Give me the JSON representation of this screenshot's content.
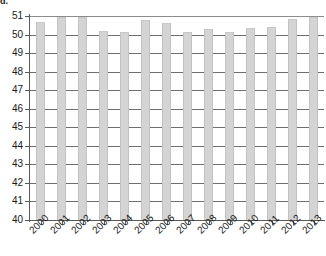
{
  "figure": {
    "label": "d.",
    "background": "#ffffff"
  },
  "style": {
    "bar_fill": "#d4d4d4",
    "bar_edge": "#c2c2c2",
    "grid_color": "#6e6e6e",
    "axis_color": "#5a5a5a",
    "text_color": "#1a1a1a"
  },
  "chart_data": {
    "type": "bar",
    "title": "",
    "subtitle": "",
    "xlabel": "",
    "ylabel": "",
    "grid": true,
    "legend": false,
    "legend_position": "none",
    "ylim": [
      40,
      51
    ],
    "ytick_step": 1,
    "ytick_labels": [
      "51",
      "50",
      "49",
      "48",
      "47",
      "46",
      "45",
      "44",
      "43",
      "42",
      "41",
      "40"
    ],
    "ytick_values": [
      51,
      50,
      49,
      48,
      47,
      46,
      45,
      44,
      43,
      42,
      41,
      40
    ],
    "categories": [
      "2000",
      "2001",
      "2002",
      "2003",
      "2004",
      "2005",
      "2006",
      "2007",
      "2008",
      "2009",
      "2010",
      "2011",
      "2012",
      "2013"
    ],
    "values": [
      50.65,
      50.95,
      50.95,
      50.2,
      50.15,
      50.8,
      50.6,
      50.15,
      50.3,
      50.15,
      50.35,
      50.4,
      50.85,
      50.95
    ]
  }
}
